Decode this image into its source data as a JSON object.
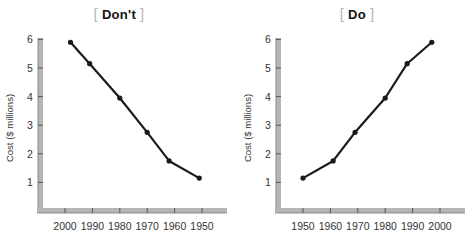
{
  "chart_data": [
    {
      "type": "line",
      "title": "Don't",
      "xlabel": "",
      "ylabel": "Cost ($ millions)",
      "x_ticks": [
        "2000",
        "1990",
        "1980",
        "1970",
        "1960",
        "1950"
      ],
      "x_axis_direction": "reversed",
      "y_ticks": [
        "1",
        "2",
        "3",
        "4",
        "5",
        "6"
      ],
      "ylim": [
        0,
        6
      ],
      "grid": false,
      "series": [
        {
          "name": "Cost",
          "x": [
            1998,
            1991,
            1980,
            1970,
            1962,
            1951
          ],
          "values": [
            5.9,
            5.15,
            3.95,
            2.75,
            1.75,
            1.15
          ]
        }
      ]
    },
    {
      "type": "line",
      "title": "Do",
      "xlabel": "",
      "ylabel": "Cost ($ millions)",
      "x_ticks": [
        "1950",
        "1960",
        "1970",
        "1980",
        "1990",
        "2000"
      ],
      "x_axis_direction": "normal",
      "y_ticks": [
        "1",
        "2",
        "3",
        "4",
        "5",
        "6"
      ],
      "ylim": [
        0,
        6
      ],
      "grid": false,
      "series": [
        {
          "name": "Cost",
          "x": [
            1950,
            1961,
            1969,
            1980,
            1988,
            1997
          ],
          "values": [
            1.15,
            1.75,
            2.75,
            3.95,
            5.15,
            5.9
          ]
        }
      ]
    }
  ],
  "panels": {
    "left": {
      "title": "Don't",
      "bracket_open": "[",
      "bracket_close": "]",
      "ylabel": "Cost ($ millions)"
    },
    "right": {
      "title": "Do",
      "bracket_open": "[",
      "bracket_close": "]",
      "ylabel": "Cost ($ millions)"
    }
  },
  "colors": {
    "line": "#1a1a1a",
    "axis": "#b5b5b5",
    "axis_edge": "#8a8a8a",
    "bracket": "#b8b8b8",
    "text": "#333333"
  }
}
